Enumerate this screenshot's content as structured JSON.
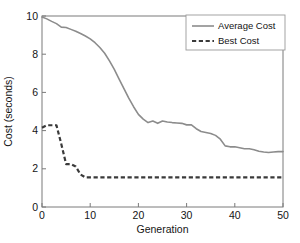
{
  "chart_data": {
    "type": "line",
    "title": "",
    "xlabel": "Generation",
    "ylabel": "Cost (seconds)",
    "xlim": [
      0,
      50
    ],
    "ylim": [
      0,
      10
    ],
    "xticks": [
      0,
      10,
      20,
      30,
      40,
      50
    ],
    "yticks": [
      0,
      2,
      4,
      6,
      8,
      10
    ],
    "grid": false,
    "legend_position": "top-right",
    "x": [
      0,
      1,
      2,
      3,
      4,
      5,
      6,
      7,
      8,
      9,
      10,
      11,
      12,
      13,
      14,
      15,
      16,
      17,
      18,
      19,
      20,
      21,
      22,
      23,
      24,
      25,
      26,
      27,
      28,
      29,
      30,
      31,
      32,
      33,
      34,
      35,
      36,
      37,
      38,
      39,
      40,
      41,
      42,
      43,
      44,
      45,
      46,
      47,
      48,
      49,
      50
    ],
    "series": [
      {
        "name": "Average Cost",
        "style": "solid",
        "color": "#8c8c8c",
        "values": [
          9.95,
          9.85,
          9.72,
          9.6,
          9.42,
          9.4,
          9.3,
          9.2,
          9.08,
          8.95,
          8.8,
          8.6,
          8.35,
          8.05,
          7.65,
          7.2,
          6.7,
          6.2,
          5.7,
          5.25,
          4.85,
          4.6,
          4.42,
          4.5,
          4.38,
          4.5,
          4.45,
          4.42,
          4.4,
          4.38,
          4.3,
          4.3,
          4.1,
          3.95,
          3.9,
          3.85,
          3.75,
          3.55,
          3.2,
          3.15,
          3.15,
          3.1,
          3.05,
          3.05,
          3.0,
          2.92,
          2.88,
          2.85,
          2.88,
          2.9,
          2.9
        ]
      },
      {
        "name": "Best Cost",
        "style": "dashed",
        "color": "#3a3a3a",
        "values": [
          4.15,
          4.28,
          4.28,
          4.28,
          3.3,
          2.25,
          2.25,
          2.12,
          1.7,
          1.55,
          1.55,
          1.55,
          1.55,
          1.55,
          1.55,
          1.55,
          1.55,
          1.55,
          1.55,
          1.55,
          1.55,
          1.55,
          1.55,
          1.55,
          1.55,
          1.55,
          1.55,
          1.55,
          1.55,
          1.55,
          1.55,
          1.55,
          1.55,
          1.55,
          1.55,
          1.55,
          1.55,
          1.55,
          1.55,
          1.55,
          1.55,
          1.55,
          1.55,
          1.55,
          1.55,
          1.55,
          1.55,
          1.55,
          1.55,
          1.55,
          1.55
        ]
      }
    ]
  },
  "legend": {
    "items": [
      {
        "label": "Average Cost"
      },
      {
        "label": "Best Cost"
      }
    ]
  }
}
